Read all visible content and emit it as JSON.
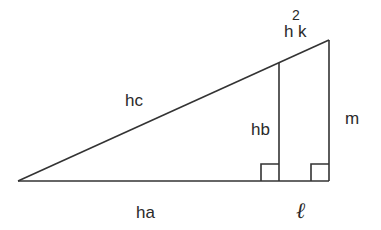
{
  "diagram": {
    "type": "right-triangle-geometry",
    "labels": {
      "hypotenuse": "hc",
      "base": "ha",
      "inner_altitude": "hb",
      "outer_side": "m",
      "top_label_base": "h",
      "top_label_exponent": "2",
      "top_label_suffix": "k",
      "base_segment": "ℓ"
    },
    "colors": {
      "line": "#333333",
      "text": "#2a2a2a",
      "background": "#ffffff"
    },
    "points": {
      "left_vertex": [
        18,
        181
      ],
      "inner_foot": [
        279,
        181
      ],
      "inner_top": [
        279,
        63
      ],
      "right_foot": [
        329,
        181
      ],
      "right_top": [
        329,
        40
      ]
    }
  }
}
